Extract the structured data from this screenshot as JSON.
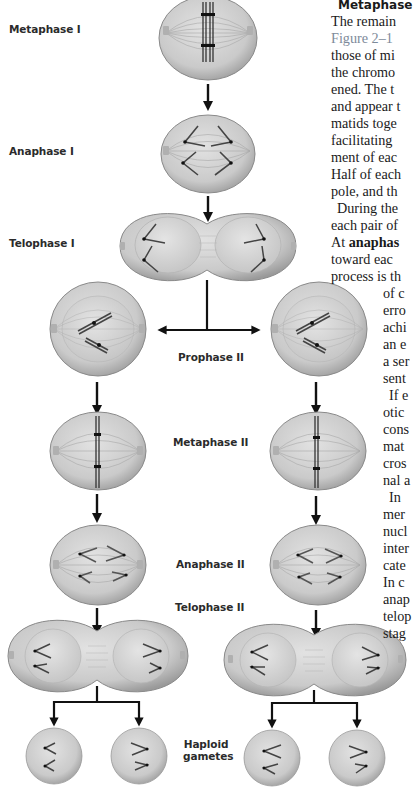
{
  "stages": {
    "metaphase_1": "Metaphase I",
    "anaphase_1": "Anaphase I",
    "telophase_1": "Telophase I",
    "prophase_2": "Prophase II",
    "metaphase_2": "Metaphase II",
    "anaphase_2": "Anaphase II",
    "telophase_2": "Telophase II",
    "haploid_gametes_line1": "Haploid",
    "haploid_gametes_line2": "gametes"
  },
  "text_column": {
    "heading": "Metaphase",
    "lines": [
      {
        "text": "The remain",
        "x": 0,
        "y": 26
      },
      {
        "text": "Figure 2–1",
        "x": 0,
        "y": 43,
        "style": "figref"
      },
      {
        "text": "those of mi",
        "x": 0,
        "y": 60
      },
      {
        "text": "the chromo",
        "x": 0,
        "y": 77
      },
      {
        "text": "ened. The t",
        "x": 0,
        "y": 94
      },
      {
        "text": "and appear t",
        "x": 0,
        "y": 111
      },
      {
        "text": "matids toge",
        "x": 0,
        "y": 128
      },
      {
        "text": "facilitating",
        "x": 0,
        "y": 145
      },
      {
        "text": "ment of eac",
        "x": 0,
        "y": 162
      },
      {
        "text": "Half of each",
        "x": 0,
        "y": 179
      },
      {
        "text": "pole, and th",
        "x": 0,
        "y": 196
      },
      {
        "text": "During the",
        "x": 6,
        "y": 213
      },
      {
        "text": "each pair of",
        "x": 0,
        "y": 230
      },
      {
        "text_prefix": "At ",
        "text_bold": "anaphas",
        "x": 0,
        "y": 247
      },
      {
        "text": "toward eac",
        "x": 0,
        "y": 264
      },
      {
        "text": "process is th",
        "x": 0,
        "y": 281
      },
      {
        "text": "of c",
        "x": 52,
        "y": 298
      },
      {
        "text": "erro",
        "x": 52,
        "y": 315
      },
      {
        "text": "achi",
        "x": 52,
        "y": 332
      },
      {
        "text": "an e",
        "x": 52,
        "y": 349
      },
      {
        "text": "a ser",
        "x": 52,
        "y": 366
      },
      {
        "text": "sent",
        "x": 52,
        "y": 383
      },
      {
        "text": "If e",
        "x": 58,
        "y": 400
      },
      {
        "text": "otic",
        "x": 52,
        "y": 417
      },
      {
        "text": "cons",
        "x": 52,
        "y": 434
      },
      {
        "text": "mat",
        "x": 52,
        "y": 451
      },
      {
        "text": "cros",
        "x": 52,
        "y": 468
      },
      {
        "text": "nal a",
        "x": 52,
        "y": 485
      },
      {
        "text": "In",
        "x": 58,
        "y": 502
      },
      {
        "text": "mer",
        "x": 52,
        "y": 519
      },
      {
        "text": "nucl",
        "x": 52,
        "y": 536
      },
      {
        "text": "inter",
        "x": 52,
        "y": 553
      },
      {
        "text": "cate",
        "x": 52,
        "y": 570
      },
      {
        "text": "In c",
        "x": 52,
        "y": 587
      },
      {
        "text": "anap",
        "x": 52,
        "y": 604
      },
      {
        "text": "telop",
        "x": 52,
        "y": 621
      },
      {
        "text": "stag",
        "x": 52,
        "y": 638
      }
    ]
  },
  "colors": {
    "cell_fill": "#cfcfcf",
    "nucleus_fill": "#dadada",
    "chromosome": "#3a3a3a",
    "arrow": "#111111",
    "label": "#2b2b2b",
    "figref": "#7d8a9a"
  }
}
